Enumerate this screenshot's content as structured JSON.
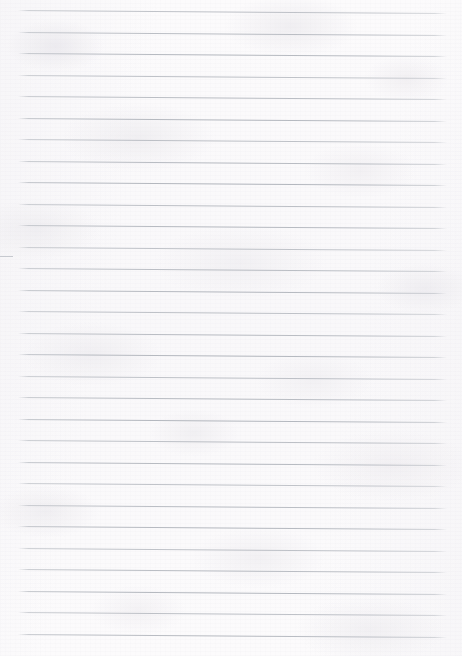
{
  "document": {
    "kind": "lined-notebook-paper",
    "title": "Blank ruled paper sheet",
    "width_px": 462,
    "height_px": 656,
    "content_text": "",
    "has_handwriting": false,
    "has_printed_text": false
  },
  "paper": {
    "background_color": "#fcfbfc",
    "texture": "mottled fibre paper",
    "tone": "near-white, faint cool grey mottling"
  },
  "ruling": {
    "line_color": "#b0b4bb",
    "line_count": 30,
    "first_line_y": 10,
    "last_line_y": 633,
    "line_spacing_px": 21.5,
    "line_thickness_px": 1,
    "line_start_x": 18,
    "line_end_x": 447,
    "tilt_px": 3,
    "margin_rule": "none",
    "lines": [
      {
        "index": 1,
        "y": 10,
        "x_start": 18,
        "x_end": 447,
        "tilt": 3
      },
      {
        "index": 2,
        "y": 31.5,
        "x_start": 18,
        "x_end": 447,
        "tilt": 3
      },
      {
        "index": 3,
        "y": 53,
        "x_start": 18,
        "x_end": 447,
        "tilt": 3
      },
      {
        "index": 4,
        "y": 74.5,
        "x_start": 18,
        "x_end": 447,
        "tilt": 3
      },
      {
        "index": 5,
        "y": 96,
        "x_start": 18,
        "x_end": 447,
        "tilt": 3
      },
      {
        "index": 6,
        "y": 117.5,
        "x_start": 18,
        "x_end": 447,
        "tilt": 3
      },
      {
        "index": 7,
        "y": 139,
        "x_start": 18,
        "x_end": 447,
        "tilt": 3
      },
      {
        "index": 8,
        "y": 160.5,
        "x_start": 18,
        "x_end": 447,
        "tilt": 3
      },
      {
        "index": 9,
        "y": 182,
        "x_start": 18,
        "x_end": 447,
        "tilt": 3
      },
      {
        "index": 10,
        "y": 203.5,
        "x_start": 18,
        "x_end": 447,
        "tilt": 3
      },
      {
        "index": 11,
        "y": 225,
        "x_start": 18,
        "x_end": 447,
        "tilt": 3
      },
      {
        "index": 12,
        "y": 246.5,
        "x_start": 18,
        "x_end": 447,
        "tilt": 3
      },
      {
        "index": 13,
        "y": 268,
        "x_start": 18,
        "x_end": 447,
        "tilt": 3
      },
      {
        "index": 14,
        "y": 289.5,
        "x_start": 18,
        "x_end": 447,
        "tilt": 3
      },
      {
        "index": 15,
        "y": 311,
        "x_start": 18,
        "x_end": 447,
        "tilt": 3
      },
      {
        "index": 16,
        "y": 332.5,
        "x_start": 18,
        "x_end": 447,
        "tilt": 3
      },
      {
        "index": 17,
        "y": 354,
        "x_start": 18,
        "x_end": 447,
        "tilt": 3
      },
      {
        "index": 18,
        "y": 375.5,
        "x_start": 18,
        "x_end": 447,
        "tilt": 3
      },
      {
        "index": 19,
        "y": 397,
        "x_start": 18,
        "x_end": 447,
        "tilt": 3
      },
      {
        "index": 20,
        "y": 418.5,
        "x_start": 18,
        "x_end": 447,
        "tilt": 3
      },
      {
        "index": 21,
        "y": 440,
        "x_start": 18,
        "x_end": 447,
        "tilt": 3
      },
      {
        "index": 22,
        "y": 461.5,
        "x_start": 18,
        "x_end": 447,
        "tilt": 3
      },
      {
        "index": 23,
        "y": 483,
        "x_start": 18,
        "x_end": 447,
        "tilt": 3
      },
      {
        "index": 24,
        "y": 504.5,
        "x_start": 18,
        "x_end": 447,
        "tilt": 3
      },
      {
        "index": 25,
        "y": 526,
        "x_start": 18,
        "x_end": 447,
        "tilt": 3
      },
      {
        "index": 26,
        "y": 547.5,
        "x_start": 18,
        "x_end": 447,
        "tilt": 3
      },
      {
        "index": 27,
        "y": 569,
        "x_start": 18,
        "x_end": 447,
        "tilt": 3
      },
      {
        "index": 28,
        "y": 590.5,
        "x_start": 18,
        "x_end": 447,
        "tilt": 3
      },
      {
        "index": 29,
        "y": 612,
        "x_start": 18,
        "x_end": 447,
        "tilt": 3
      },
      {
        "index": 30,
        "y": 633.5,
        "x_start": 18,
        "x_end": 447,
        "tilt": 3
      }
    ]
  },
  "marks": [
    {
      "name": "left-edge-stub",
      "x": 0,
      "y": 256,
      "width": 13,
      "color": "#c6c9cf"
    }
  ]
}
